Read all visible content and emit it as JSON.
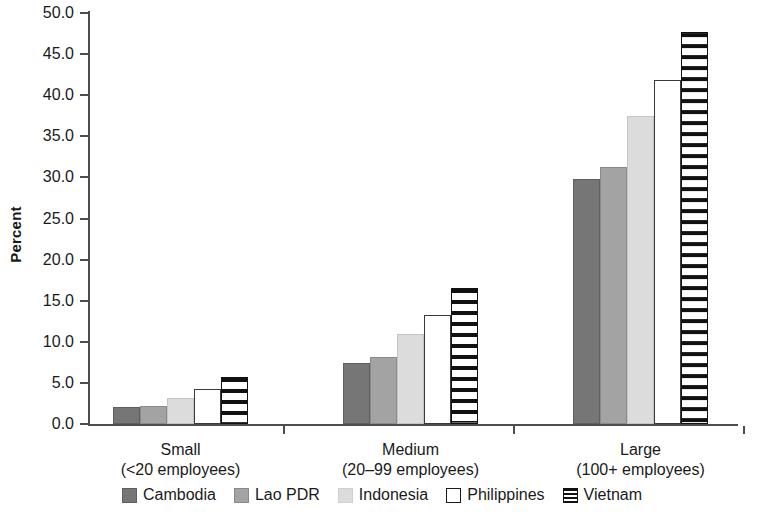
{
  "chart_data": {
    "type": "bar",
    "title": "",
    "subtitle": "",
    "xlabel": "",
    "ylabel": "Percent",
    "ylim": [
      0.0,
      50.0
    ],
    "ytick_step": 5.0,
    "ytick_labels": [
      "0.0",
      "5.0",
      "10.0",
      "15.0",
      "20.0",
      "25.0",
      "30.0",
      "35.0",
      "40.0",
      "45.0",
      "50.0"
    ],
    "grid": false,
    "legend_position": "bottom",
    "categories": [
      "Small",
      "Medium",
      "Large"
    ],
    "category_sublabels": [
      "(<20 employees)",
      "(20–99 employees)",
      "(100+ employees)"
    ],
    "series": [
      {
        "name": "Cambodia",
        "color": "#767676",
        "pattern": "solid",
        "values": [
          2.1,
          7.4,
          29.8
        ]
      },
      {
        "name": "Lao PDR",
        "color": "#a3a3a3",
        "pattern": "solid",
        "values": [
          2.2,
          8.1,
          31.3
        ]
      },
      {
        "name": "Indonesia",
        "color": "#dcdcdc",
        "pattern": "solid",
        "values": [
          3.2,
          11.0,
          37.5
        ]
      },
      {
        "name": "Philippines",
        "color": "#ffffff",
        "pattern": "outline",
        "values": [
          4.3,
          13.3,
          41.9
        ]
      },
      {
        "name": "Vietnam",
        "color": "#111111",
        "pattern": "horizontal-stripes",
        "values": [
          5.7,
          16.5,
          47.7
        ]
      }
    ]
  },
  "axis": {
    "y_title": "Percent"
  },
  "legend": {
    "items": [
      {
        "label": "Cambodia",
        "swatch": "cambodia"
      },
      {
        "label": "Lao PDR",
        "swatch": "lao"
      },
      {
        "label": "Indonesia",
        "swatch": "indonesia"
      },
      {
        "label": "Philippines",
        "swatch": "philippines"
      },
      {
        "label": "Vietnam",
        "swatch": "vietnam"
      }
    ]
  }
}
